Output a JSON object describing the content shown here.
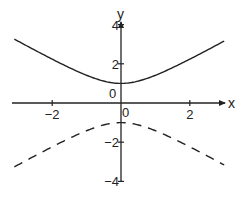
{
  "chart_data": {
    "type": "line",
    "title": "",
    "xlabel": "x",
    "ylabel": "y",
    "xlim": [
      -3.2,
      3.0
    ],
    "ylim": [
      -4,
      4
    ],
    "grid": false,
    "legend": null,
    "x_ticks": [
      -2,
      0,
      2
    ],
    "y_ticks": [
      -4,
      -2,
      0,
      2,
      4
    ],
    "x_tick_labels": [
      "-2",
      "0",
      "2"
    ],
    "y_tick_labels": [
      "-4",
      "-2",
      "0",
      "2",
      "4"
    ],
    "series": [
      {
        "name": "upper branch",
        "style": "solid",
        "x": [
          -3.0,
          -2.5,
          -2.0,
          -1.5,
          -1.0,
          -0.5,
          0.0,
          0.5,
          1.0,
          1.5,
          2.0,
          2.5,
          3.0
        ],
        "y": [
          3.16,
          2.69,
          2.24,
          1.8,
          1.41,
          1.12,
          1.0,
          1.12,
          1.41,
          1.8,
          2.24,
          2.69,
          3.16
        ]
      },
      {
        "name": "lower branch",
        "style": "dashed",
        "x": [
          -3.0,
          -2.5,
          -2.0,
          -1.5,
          -1.0,
          -0.5,
          0.0,
          0.5,
          1.0,
          1.5,
          2.0,
          2.5,
          3.0
        ],
        "y": [
          -3.16,
          -2.69,
          -2.24,
          -1.8,
          -1.41,
          -1.12,
          -1.0,
          -1.12,
          -1.41,
          -1.8,
          -2.24,
          -2.69,
          -3.16
        ]
      }
    ],
    "annotations": {
      "origin_label_upper": "0",
      "origin_label_lower": "0"
    }
  },
  "axes": {
    "x_label": "x",
    "y_label": "y",
    "x_ticks": [
      {
        "value": -2,
        "label": "−2"
      },
      {
        "value": 2,
        "label": "2"
      }
    ],
    "y_ticks": [
      {
        "value": 4,
        "label": "4"
      },
      {
        "value": 2,
        "label": "2"
      },
      {
        "value": -2,
        "label": "−2"
      },
      {
        "value": -4,
        "label": "−4"
      }
    ],
    "origin_labels": [
      "0",
      "0"
    ]
  }
}
